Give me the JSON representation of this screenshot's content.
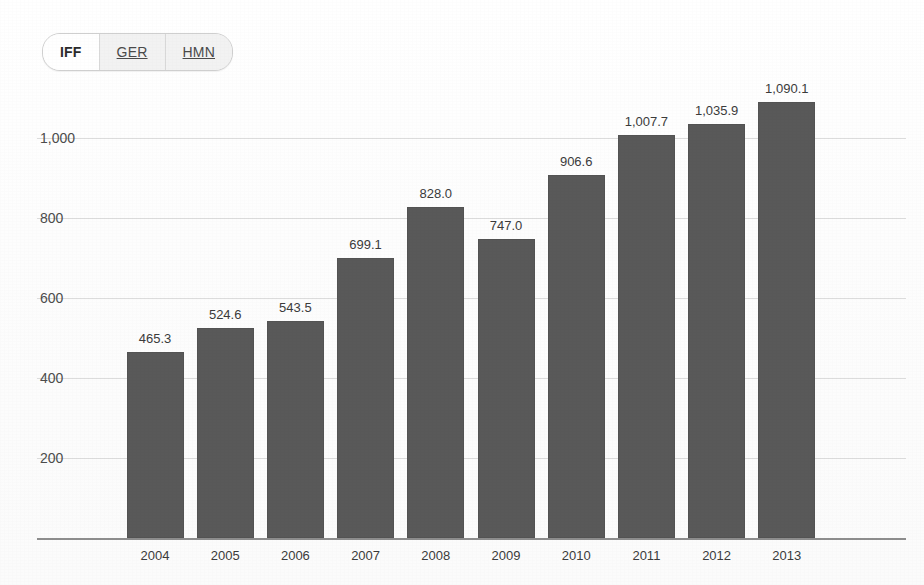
{
  "tabs": [
    {
      "label": "IFF",
      "active": true
    },
    {
      "label": "GER",
      "active": false
    },
    {
      "label": "HMN",
      "active": false
    }
  ],
  "chart_data": {
    "type": "bar",
    "title": "",
    "xlabel": "",
    "ylabel": "",
    "categories": [
      "2004",
      "2005",
      "2006",
      "2007",
      "2008",
      "2009",
      "2010",
      "2011",
      "2012",
      "2013"
    ],
    "values": [
      465.3,
      524.6,
      543.5,
      699.1,
      828.0,
      747.0,
      906.6,
      1007.7,
      1035.9,
      1090.1
    ],
    "value_labels": [
      "465.3",
      "524.6",
      "543.5",
      "699.1",
      "828.0",
      "747.0",
      "906.6",
      "1,007.7",
      "1,035.9",
      "1,090.1"
    ],
    "yticks": [
      200,
      400,
      600,
      800,
      1000
    ],
    "ytick_labels": [
      "200",
      "400",
      "600",
      "800",
      "1,000"
    ],
    "ylim": [
      0,
      1200
    ],
    "grid": true,
    "legend": "none",
    "bar_color": "#595959",
    "gridline_color": "#dcdcdc",
    "axis_color": "#8d8d8d"
  }
}
